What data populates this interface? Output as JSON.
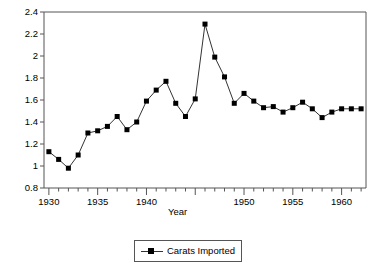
{
  "chart_data": {
    "type": "line",
    "title": "",
    "xlabel": "Year",
    "ylabel": "(Millions)",
    "xlim": [
      1929.5,
      1962.5
    ],
    "ylim": [
      0.8,
      2.4
    ],
    "grid": false,
    "legend_position": "bottom-center",
    "legend_entries": [
      "Carats Imported"
    ],
    "series_name": "Carats Imported",
    "marker": "square",
    "marker_color": "#000000",
    "line_color": "#333333",
    "x_tick_labels": [
      "1930",
      "1935",
      "1940",
      "1950",
      "1955",
      "1960"
    ],
    "x_major_ticks": [
      1930,
      1935,
      1940,
      1945,
      1950,
      1955,
      1960
    ],
    "x_minor_tick_interval": 1,
    "y_tick_labels": [
      "0.8",
      "1",
      "1.2",
      "1.4",
      "1.6",
      "1.8",
      "2",
      "2.2",
      "2.4"
    ],
    "y_ticks": [
      0.8,
      1.0,
      1.2,
      1.4,
      1.6,
      1.8,
      2.0,
      2.2,
      2.4
    ],
    "x": [
      1930,
      1931,
      1932,
      1933,
      1934,
      1935,
      1936,
      1937,
      1938,
      1939,
      1940,
      1941,
      1942,
      1943,
      1944,
      1945,
      1946,
      1947,
      1948,
      1949,
      1950,
      1951,
      1952,
      1953,
      1954,
      1955,
      1956,
      1957,
      1958,
      1959,
      1960,
      1961,
      1962
    ],
    "values": [
      1.13,
      1.06,
      0.98,
      1.1,
      1.3,
      1.32,
      1.36,
      1.45,
      1.33,
      1.4,
      1.59,
      1.69,
      1.77,
      1.57,
      1.45,
      1.61,
      2.29,
      1.99,
      1.81,
      1.57,
      1.66,
      1.59,
      1.53,
      1.54,
      1.49,
      1.53,
      1.58,
      1.52,
      1.44,
      1.49,
      1.52,
      1.52,
      1.52
    ]
  }
}
